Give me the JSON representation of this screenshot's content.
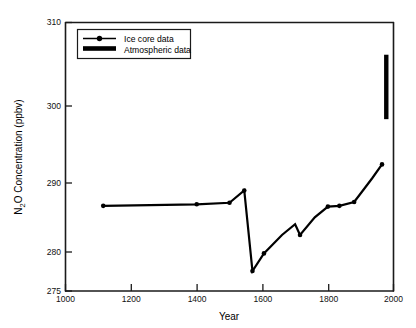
{
  "chart_data": {
    "type": "line",
    "title": "",
    "xlabel": "Year",
    "ylabel": "N₂O Concentration (ppbv)",
    "xlim": [
      1000,
      2000
    ],
    "ylim": [
      275,
      310
    ],
    "grid": false,
    "legend_position": "top-left-inside",
    "x_ticks": [
      1000,
      1200,
      1400,
      1600,
      1800,
      2000
    ],
    "x_tick_labels": [
      "1000",
      "1200",
      "1400",
      "1600",
      "1800",
      "2000"
    ],
    "y_ticks": [
      275,
      280,
      290,
      300,
      310
    ],
    "y_tick_labels": [
      "275",
      "280",
      "290",
      "300",
      "310"
    ],
    "series": [
      {
        "name": "Ice core data",
        "marker": "circle-line",
        "x": [
          1115,
          1400,
          1500,
          1545,
          1570,
          1605,
          1660,
          1700,
          1715,
          1760,
          1800,
          1835,
          1880,
          1905,
          1935,
          1965
        ],
        "values": [
          286.1,
          286.3,
          286.5,
          288.1,
          277.6,
          279.9,
          282.3,
          283.7,
          282.3,
          284.6,
          286.0,
          286.1,
          286.6,
          288.0,
          289.7,
          291.5
        ]
      },
      {
        "name": "Atmospheric data",
        "marker": "thick-vertical-bar",
        "x": [
          1978,
          1978
        ],
        "values": [
          297.4,
          305.8
        ]
      }
    ],
    "legend": [
      {
        "label": "Ice core data",
        "sample": "line-with-dot"
      },
      {
        "label": "Atmospheric data",
        "sample": "thick-bar"
      }
    ]
  },
  "colors": {
    "ink": "#000000",
    "axis": "#1a1a1a",
    "background": "#ffffff"
  }
}
